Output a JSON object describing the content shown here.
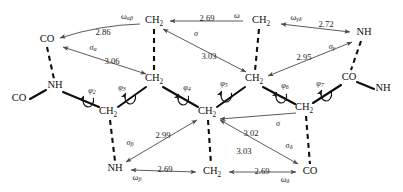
{
  "figure": {
    "kind": "molecular-conformation-diagram",
    "ink_color": "#0d0d0d",
    "arrow_color": "#4a4a4a",
    "background": "#ffffff"
  },
  "atoms": [
    {
      "id": "co_topleft",
      "text": "CO",
      "sub": "",
      "x": 47,
      "y": 40
    },
    {
      "id": "ch2_top_a",
      "text": "CH",
      "sub": "2",
      "x": 154,
      "y": 21
    },
    {
      "id": "ch2_top_b",
      "text": "CH",
      "sub": "2",
      "x": 261,
      "y": 21
    },
    {
      "id": "nh_topright",
      "text": "NH",
      "sub": "",
      "x": 364,
      "y": 33
    },
    {
      "id": "nh_left",
      "text": "NH",
      "sub": "",
      "x": 55,
      "y": 86
    },
    {
      "id": "co_farleft",
      "text": "CO",
      "sub": "",
      "x": 19,
      "y": 99
    },
    {
      "id": "ch2_mid_a",
      "text": "CH",
      "sub": "2",
      "x": 154,
      "y": 79
    },
    {
      "id": "ch2_mid_b",
      "text": "CH",
      "sub": "2",
      "x": 254,
      "y": 79
    },
    {
      "id": "co_right",
      "text": "CO",
      "sub": "",
      "x": 349,
      "y": 78
    },
    {
      "id": "nh_farright",
      "text": "NH",
      "sub": "",
      "x": 383,
      "y": 89
    },
    {
      "id": "ch2_low_a",
      "text": "CH",
      "sub": "2",
      "x": 108,
      "y": 112
    },
    {
      "id": "ch2_low_b",
      "text": "CH",
      "sub": "2",
      "x": 207,
      "y": 112
    },
    {
      "id": "ch2_low_c",
      "text": "CH",
      "sub": "2",
      "x": 304,
      "y": 108
    },
    {
      "id": "nh_bottom",
      "text": "NH",
      "sub": "",
      "x": 115,
      "y": 169
    },
    {
      "id": "ch2_bottom",
      "text": "CH",
      "sub": "2",
      "x": 212,
      "y": 172
    },
    {
      "id": "co_bottom",
      "text": "CO",
      "sub": "",
      "x": 310,
      "y": 172
    }
  ],
  "distances": [
    {
      "id": "d_286",
      "value": "2.86",
      "x": 103,
      "y": 33
    },
    {
      "id": "d_269_top",
      "value": "2.69",
      "x": 207,
      "y": 19
    },
    {
      "id": "d_272",
      "value": "2.72",
      "x": 326,
      "y": 25
    },
    {
      "id": "d_306",
      "value": "3.06",
      "x": 112,
      "y": 62
    },
    {
      "id": "d_303_upper",
      "value": "3.03",
      "x": 209,
      "y": 57
    },
    {
      "id": "d_295",
      "value": "2.95",
      "x": 304,
      "y": 58
    },
    {
      "id": "d_299",
      "value": "2.99",
      "x": 163,
      "y": 136
    },
    {
      "id": "d_302",
      "value": "3.02",
      "x": 251,
      "y": 134
    },
    {
      "id": "d_303_lower",
      "value": "3.03",
      "x": 244,
      "y": 152
    },
    {
      "id": "d_269_bl",
      "value": "2.69",
      "x": 165,
      "y": 170
    },
    {
      "id": "d_269_br",
      "value": "2.69",
      "x": 262,
      "y": 172
    }
  ],
  "greek_labels": [
    {
      "id": "omega_ab",
      "base": "ω",
      "sub": "αβ",
      "x": 127,
      "y": 17
    },
    {
      "id": "omega_plain_top",
      "base": "ω",
      "sub": "",
      "x": 237,
      "y": 16
    },
    {
      "id": "omega_gd",
      "base": "ω",
      "sub": "γδ",
      "x": 296,
      "y": 18
    },
    {
      "id": "sigma_alpha",
      "base": "σ",
      "sub": "α",
      "x": 93,
      "y": 48
    },
    {
      "id": "sigma_upper",
      "base": "σ",
      "sub": "",
      "x": 196,
      "y": 34
    },
    {
      "id": "sigma_gamma",
      "base": "σ",
      "sub": "γ",
      "x": 332,
      "y": 47
    },
    {
      "id": "sigma_beta",
      "base": "σ",
      "sub": "β",
      "x": 130,
      "y": 143
    },
    {
      "id": "sigma_lower",
      "base": "σ",
      "sub": "",
      "x": 278,
      "y": 124
    },
    {
      "id": "sigma_delta",
      "base": "σ",
      "sub": "δ",
      "x": 289,
      "y": 146
    },
    {
      "id": "omega_beta",
      "base": "ω",
      "sub": "β",
      "x": 137,
      "y": 178
    },
    {
      "id": "omega_delta",
      "base": "ω",
      "sub": "δ",
      "x": 285,
      "y": 180
    }
  ],
  "torsions": [
    {
      "id": "phi2",
      "base": "φ",
      "sub": "2",
      "x": 92,
      "y": 91
    },
    {
      "id": "phi3",
      "base": "φ",
      "sub": "3",
      "x": 122,
      "y": 88
    },
    {
      "id": "phi4",
      "base": "φ",
      "sub": "4",
      "x": 187,
      "y": 88
    },
    {
      "id": "phi5",
      "base": "φ",
      "sub": "5",
      "x": 224,
      "y": 84
    },
    {
      "id": "phi6",
      "base": "φ",
      "sub": "6",
      "x": 285,
      "y": 86
    },
    {
      "id": "phi7",
      "base": "φ",
      "sub": "7",
      "x": 320,
      "y": 84
    }
  ],
  "torsion_arcs": [
    {
      "id": "arc-phi2",
      "cx": 88,
      "cy": 100
    },
    {
      "id": "arc-phi3",
      "cx": 130,
      "cy": 97
    },
    {
      "id": "arc-phi4",
      "cx": 183,
      "cy": 98
    },
    {
      "id": "arc-phi5",
      "cx": 226,
      "cy": 95
    },
    {
      "id": "arc-phi6",
      "cx": 281,
      "cy": 96
    },
    {
      "id": "arc-phi7",
      "cx": 326,
      "cy": 94
    }
  ],
  "solid_bonds": [
    {
      "id": "bond-co-nh-left",
      "x1": 30,
      "y1": 99,
      "x2": 46,
      "y2": 90
    },
    {
      "id": "bond-nh-ch2lowa",
      "x1": 63,
      "y1": 92,
      "x2": 99,
      "y2": 107
    },
    {
      "id": "bond-ch2lowa-ch2mida",
      "x1": 118,
      "y1": 107,
      "x2": 146,
      "y2": 87
    },
    {
      "id": "bond-ch2mida-ch2lowb",
      "x1": 163,
      "y1": 87,
      "x2": 198,
      "y2": 107
    },
    {
      "id": "bond-ch2lowb-ch2midb",
      "x1": 217,
      "y1": 107,
      "x2": 245,
      "y2": 87
    },
    {
      "id": "bond-ch2midb-ch2lowc",
      "x1": 263,
      "y1": 87,
      "x2": 295,
      "y2": 104
    },
    {
      "id": "bond-ch2lowc-coright",
      "x1": 313,
      "y1": 103,
      "x2": 341,
      "y2": 85
    },
    {
      "id": "bond-coright-nhfar",
      "x1": 357,
      "y1": 82,
      "x2": 374,
      "y2": 89
    }
  ],
  "dashed_bonds": [
    {
      "id": "hb-co-nh-left",
      "x1": 47,
      "y1": 47,
      "x2": 54,
      "y2": 79
    },
    {
      "id": "hb-ch2topa-ch2mida",
      "x1": 154,
      "y1": 29,
      "x2": 154,
      "y2": 71
    },
    {
      "id": "hb-ch2topb-ch2midb",
      "x1": 259,
      "y1": 29,
      "x2": 255,
      "y2": 71
    },
    {
      "id": "hb-nhtr-coright",
      "x1": 361,
      "y1": 41,
      "x2": 351,
      "y2": 70
    },
    {
      "id": "hb-ch2lowa-nhbottom",
      "x1": 110,
      "y1": 120,
      "x2": 115,
      "y2": 161
    },
    {
      "id": "hb-ch2lowb-ch2bottom",
      "x1": 208,
      "y1": 120,
      "x2": 211,
      "y2": 164
    },
    {
      "id": "hb-ch2lowc-cobottom",
      "x1": 306,
      "y1": 116,
      "x2": 310,
      "y2": 164
    }
  ],
  "hbond_arrows": [
    {
      "id": "arrow-286-co",
      "x1": 140,
      "y1": 24,
      "x2": 60,
      "y2": 38,
      "double": false,
      "bend": -6
    },
    {
      "id": "arrow-269-top",
      "x1": 243,
      "y1": 21,
      "x2": 170,
      "y2": 21,
      "double": false,
      "bend": 0
    },
    {
      "id": "arrow-272-nh",
      "x1": 281,
      "y1": 24,
      "x2": 350,
      "y2": 32,
      "double": true,
      "bend": 0
    },
    {
      "id": "arrow-306",
      "x1": 63,
      "y1": 47,
      "x2": 146,
      "y2": 74,
      "double": true,
      "bend": 0
    },
    {
      "id": "arrow-303-upper",
      "x1": 163,
      "y1": 29,
      "x2": 246,
      "y2": 72,
      "double": true,
      "bend": 0
    },
    {
      "id": "arrow-295",
      "x1": 352,
      "y1": 42,
      "x2": 268,
      "y2": 76,
      "double": true,
      "bend": 0
    },
    {
      "id": "arrow-299",
      "x1": 197,
      "y1": 120,
      "x2": 126,
      "y2": 162,
      "double": true,
      "bend": 0
    },
    {
      "id": "arrow-302",
      "x1": 296,
      "y1": 113,
      "x2": 220,
      "y2": 119,
      "double": false,
      "bend": 0
    },
    {
      "id": "arrow-303-lower",
      "x1": 298,
      "y1": 164,
      "x2": 220,
      "y2": 120,
      "double": true,
      "bend": 0
    },
    {
      "id": "arrow-269-bottom-l",
      "x1": 196,
      "y1": 172,
      "x2": 131,
      "y2": 170,
      "double": true,
      "bend": 0
    },
    {
      "id": "arrow-269-bottom-r",
      "x1": 229,
      "y1": 172,
      "x2": 296,
      "y2": 172,
      "double": true,
      "bend": 0
    }
  ]
}
